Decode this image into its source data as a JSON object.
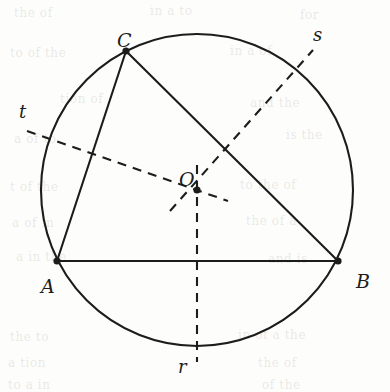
{
  "figure": {
    "kind": "geometry-diagram",
    "background_color": "#fdfdfb",
    "ink_color": "#1c1c1c"
  },
  "chart_data": {
    "type": "scatter",
    "title": "",
    "xlabel": "",
    "ylabel": "",
    "xlim": [
      0,
      390
    ],
    "ylim": [
      392,
      0
    ],
    "grid": false,
    "legend": "none",
    "circle": {
      "center": [
        197,
        190
      ],
      "radius": 156,
      "center_label": "O",
      "style": "solid"
    },
    "points": [
      {
        "label": "A",
        "x": 57,
        "y": 261,
        "marker": "filled-dot",
        "label_dx": -16,
        "label_dy": 17
      },
      {
        "label": "B",
        "x": 338,
        "y": 261,
        "marker": "filled-dot",
        "label_dx": 18,
        "label_dy": 11
      },
      {
        "label": "C",
        "x": 126,
        "y": 51,
        "marker": "filled-dot",
        "label_dx": -9,
        "label_dy": -20
      },
      {
        "label": "O",
        "x": 197,
        "y": 190,
        "marker": "filled-dot",
        "label_dx": -18,
        "label_dy": -20
      }
    ],
    "solid_segments": [
      {
        "name": "AB",
        "from": "A",
        "to": "B",
        "x1": 57,
        "y1": 261,
        "x2": 338,
        "y2": 261
      },
      {
        "name": "AC",
        "from": "A",
        "to": "C",
        "x1": 57,
        "y1": 261,
        "x2": 126,
        "y2": 51
      },
      {
        "name": "CB",
        "from": "C",
        "to": "B",
        "x1": 126,
        "y1": 51,
        "x2": 338,
        "y2": 261
      }
    ],
    "dashed_lines": [
      {
        "name": "r",
        "label": "r",
        "bisects": "AB",
        "x1": 197,
        "y1": 165,
        "x2": 197,
        "y2": 362,
        "label_x": 178,
        "label_y": 358
      },
      {
        "name": "s",
        "label": "s",
        "bisects": "CB",
        "x1": 170,
        "y1": 211,
        "x2": 313,
        "y2": 50,
        "label_x": 313,
        "label_y": 26
      },
      {
        "name": "t",
        "label": "t",
        "bisects": "AC",
        "x1": 27,
        "y1": 131,
        "x2": 228,
        "y2": 201,
        "label_x": 19,
        "label_y": 103
      }
    ],
    "annotations": [
      {
        "text": "A",
        "x": 41,
        "y": 277
      },
      {
        "text": "B",
        "x": 356,
        "y": 272
      },
      {
        "text": "C",
        "x": 117,
        "y": 31
      },
      {
        "text": "O",
        "x": 179,
        "y": 170
      },
      {
        "text": "r",
        "x": 178,
        "y": 358
      },
      {
        "text": "s",
        "x": 313,
        "y": 26
      },
      {
        "text": "t",
        "x": 19,
        "y": 103
      }
    ]
  },
  "labels": {
    "A": "A",
    "B": "B",
    "C": "C",
    "O": "O",
    "r": "r",
    "s": "s",
    "t": "t"
  },
  "bleed_through": {
    "note": "faint reversed text showing through the paper",
    "lines": [
      {
        "text": "the of",
        "x": 14,
        "y": 6
      },
      {
        "text": "in a to",
        "x": 150,
        "y": 4
      },
      {
        "text": "for",
        "x": 300,
        "y": 8
      },
      {
        "text": "to of the",
        "x": 10,
        "y": 46
      },
      {
        "text": "in a of",
        "x": 230,
        "y": 44
      },
      {
        "text": "tion of",
        "x": 60,
        "y": 92
      },
      {
        "text": "and the",
        "x": 250,
        "y": 96
      },
      {
        "text": "a of to",
        "x": 14,
        "y": 132
      },
      {
        "text": "is the",
        "x": 286,
        "y": 128
      },
      {
        "text": "t of the",
        "x": 10,
        "y": 180
      },
      {
        "text": "to the of",
        "x": 240,
        "y": 178
      },
      {
        "text": "a of in",
        "x": 12,
        "y": 216
      },
      {
        "text": "the of a",
        "x": 246,
        "y": 214
      },
      {
        "text": "a in the",
        "x": 16,
        "y": 250
      },
      {
        "text": "and is",
        "x": 268,
        "y": 252
      },
      {
        "text": "the to",
        "x": 10,
        "y": 330
      },
      {
        "text": "in of a the",
        "x": 238,
        "y": 328
      },
      {
        "text": "a tion",
        "x": 8,
        "y": 356
      },
      {
        "text": "the of",
        "x": 258,
        "y": 356
      },
      {
        "text": "to a in",
        "x": 8,
        "y": 378
      },
      {
        "text": "of the",
        "x": 262,
        "y": 378
      }
    ]
  }
}
